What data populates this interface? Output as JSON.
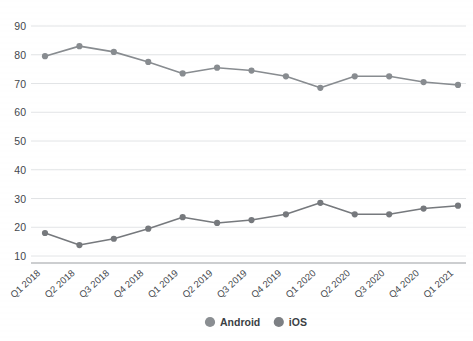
{
  "chart_data": {
    "type": "line",
    "title": "",
    "xlabel": "",
    "ylabel": "",
    "ylim": [
      5,
      95
    ],
    "yticks": [
      10,
      20,
      30,
      40,
      50,
      60,
      70,
      80,
      90
    ],
    "grid": true,
    "legend_position": "bottom",
    "categories": [
      "Q1 2018",
      "Q2 2018",
      "Q3 2018",
      "Q4 2018",
      "Q1 2019",
      "Q2 2019",
      "Q3 2019",
      "Q4 2019",
      "Q1 2020",
      "Q2 2020",
      "Q3 2020",
      "Q4 2020",
      "Q1 2021"
    ],
    "series": [
      {
        "name": "Android",
        "color": "#888c90",
        "values": [
          79.5,
          83.0,
          81.0,
          77.5,
          73.5,
          75.5,
          74.5,
          72.5,
          68.5,
          72.5,
          72.5,
          70.5,
          69.5
        ]
      },
      {
        "name": "iOS",
        "color": "#76797d",
        "values": [
          18.0,
          13.8,
          16.0,
          19.5,
          23.5,
          21.5,
          22.5,
          24.5,
          28.5,
          24.5,
          24.5,
          26.5,
          27.5
        ]
      }
    ]
  },
  "legend": {
    "items": [
      {
        "label": "Android",
        "marker_color": "#8a8e92"
      },
      {
        "label": "iOS",
        "marker_color": "#7d8084"
      }
    ]
  },
  "axes": {
    "y_tick_labels": [
      "90",
      "80",
      "70",
      "60",
      "50",
      "40",
      "30",
      "20",
      "10"
    ],
    "x_tick_labels": [
      "Q1 2018",
      "Q2 2018",
      "Q3 2018",
      "Q4 2018",
      "Q1 2019",
      "Q2 2019",
      "Q3 2019",
      "Q4 2019",
      "Q1 2020",
      "Q2 2020",
      "Q3 2020",
      "Q4 2020",
      "Q1 2021"
    ]
  },
  "colors": {
    "background": "#ffffff",
    "gridline": "#e2e4e6",
    "text": "#44484d",
    "series_android": "#888c90",
    "series_ios": "#76797d"
  }
}
